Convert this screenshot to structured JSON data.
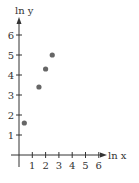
{
  "chart_data": {
    "type": "scatter",
    "title": "",
    "xlabel": "ln x",
    "ylabel": "ln y",
    "x_ticks": [
      "1",
      "2",
      "3",
      "4",
      "5",
      "6"
    ],
    "y_ticks": [
      "1",
      "2",
      "3",
      "4",
      "5",
      "6"
    ],
    "xlim": [
      0,
      6.5
    ],
    "ylim": [
      0,
      6.5
    ],
    "grid": false,
    "legend": null,
    "series": [
      {
        "name": "data",
        "color": "#666666",
        "points": [
          {
            "x": 0.4,
            "y": 1.6
          },
          {
            "x": 1.5,
            "y": 3.4
          },
          {
            "x": 2.0,
            "y": 4.3
          },
          {
            "x": 2.5,
            "y": 5.0
          }
        ]
      }
    ]
  },
  "colors": {
    "axis": "#333333",
    "point": "#666666"
  }
}
